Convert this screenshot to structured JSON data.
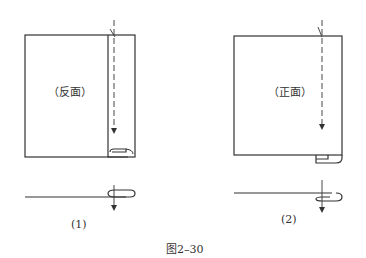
{
  "figure": {
    "caption": "图2–30",
    "panels": [
      {
        "label": "(1)",
        "side_text": "（反面）"
      },
      {
        "label": "(2)",
        "side_text": "（正面）"
      }
    ],
    "line_color": "#333333"
  }
}
